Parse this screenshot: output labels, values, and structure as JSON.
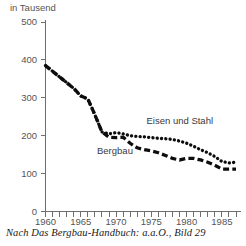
{
  "chart_data": {
    "type": "line",
    "title": "",
    "subtitle": "",
    "unit_label": "in Tausend",
    "xlabel": "",
    "ylabel": "",
    "ylim": [
      0,
      500
    ],
    "xlim": [
      1960,
      1987
    ],
    "grid": false,
    "legend_position": "inline-annotations",
    "y_ticks": [
      0,
      100,
      200,
      300,
      400,
      500
    ],
    "y_tick_labels": [
      "0",
      "100",
      "200",
      "300",
      "400",
      "500"
    ],
    "x_ticks": [
      1960,
      1961,
      1962,
      1963,
      1964,
      1965,
      1966,
      1967,
      1968,
      1969,
      1970,
      1971,
      1972,
      1973,
      1974,
      1975,
      1976,
      1977,
      1978,
      1979,
      1980,
      1981,
      1982,
      1983,
      1984,
      1985,
      1986,
      1987
    ],
    "x_tick_labels_shown": [
      "1960",
      "1965",
      "1970",
      "1975",
      "1980",
      "1985"
    ],
    "x_tick_labels_shown_values": [
      1960,
      1965,
      1970,
      1975,
      1980,
      1985
    ],
    "x": [
      1960,
      1961,
      1962,
      1963,
      1964,
      1965,
      1966,
      1967,
      1968,
      1969,
      1970,
      1971,
      1972,
      1973,
      1974,
      1975,
      1976,
      1977,
      1978,
      1979,
      1980,
      1981,
      1982,
      1983,
      1984,
      1985,
      1986,
      1987
    ],
    "series": [
      {
        "name": "Eisen und Stahl",
        "style": "dotted",
        "color": "#0d0d0d",
        "label_text": "Eisen und Stahl",
        "values": [
          385,
          370,
          355,
          340,
          325,
          305,
          297,
          255,
          210,
          205,
          208,
          205,
          200,
          198,
          197,
          195,
          193,
          192,
          190,
          186,
          180,
          172,
          163,
          155,
          145,
          132,
          128,
          130
        ]
      },
      {
        "name": "Bergbau",
        "style": "dashed",
        "color": "#0d0d0d",
        "label_text": "Bergbau",
        "values": [
          385,
          370,
          355,
          340,
          325,
          305,
          297,
          255,
          210,
          196,
          195,
          196,
          180,
          168,
          163,
          160,
          155,
          148,
          140,
          136,
          140,
          140,
          136,
          130,
          122,
          112,
          112,
          112
        ]
      }
    ],
    "annotations": [
      {
        "text": "Eisen und Stahl",
        "x": 1978,
        "y": 230
      },
      {
        "text": "Bergbau",
        "x": 1969,
        "y": 152
      }
    ],
    "caption": "Nach Das Bergbau-Handbuch: a.a.O., Bild 29"
  },
  "axes": {
    "unit_label": "in Tausend"
  },
  "colors": {
    "axis": "#6e6e6e",
    "text": "#555555",
    "series": "#0d0d0d",
    "background": "#ffffff"
  }
}
